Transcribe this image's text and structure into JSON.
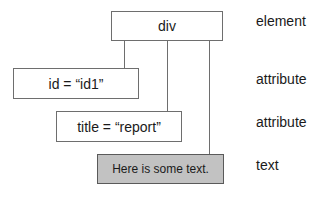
{
  "diagram": {
    "nodes": {
      "element": {
        "label": "div",
        "kind": "element"
      },
      "attr_id": {
        "label": "id = “id1”",
        "kind": "attribute"
      },
      "attr_title": {
        "label": "title = “report”",
        "kind": "attribute"
      },
      "text": {
        "label": "Here is some text.",
        "kind": "text"
      }
    },
    "edges": [
      {
        "from": "element",
        "to": "attr_id"
      },
      {
        "from": "element",
        "to": "attr_title"
      },
      {
        "from": "element",
        "to": "text"
      }
    ],
    "legend": {
      "row1": "element",
      "row2": "attribute",
      "row3": "attribute",
      "row4": "text"
    },
    "colors": {
      "border": "#6e6e6e",
      "text_node_fill": "#c2c2c2",
      "background": "#ffffff"
    }
  }
}
